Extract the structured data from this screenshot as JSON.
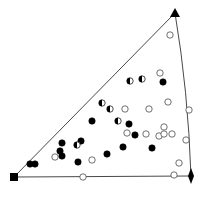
{
  "diagram": {
    "type": "inverse-pole-figure-triangle",
    "corners": {
      "square": {
        "x": 14,
        "y": 177
      },
      "triangle": {
        "x": 175,
        "y": 13
      },
      "diamond": {
        "x": 191,
        "y": 176
      }
    },
    "edges": {
      "left": [
        [
          14,
          177
        ],
        [
          175,
          13
        ]
      ],
      "bottom": [
        [
          14,
          177
        ],
        [
          191,
          176
        ]
      ],
      "right_arc": [
        [
          175,
          13
        ],
        [
          191,
          176
        ]
      ]
    },
    "points": [
      {
        "x": 170,
        "y": 35,
        "type": "open"
      },
      {
        "x": 160,
        "y": 73,
        "type": "open"
      },
      {
        "x": 130,
        "y": 81,
        "type": "half"
      },
      {
        "x": 142,
        "y": 79,
        "type": "half"
      },
      {
        "x": 163,
        "y": 82,
        "type": "filled"
      },
      {
        "x": 102,
        "y": 103,
        "type": "half"
      },
      {
        "x": 110,
        "y": 109,
        "type": "half"
      },
      {
        "x": 125,
        "y": 109,
        "type": "open"
      },
      {
        "x": 149,
        "y": 109,
        "type": "open"
      },
      {
        "x": 168,
        "y": 102,
        "type": "open"
      },
      {
        "x": 189,
        "y": 110,
        "type": "open"
      },
      {
        "x": 92,
        "y": 121,
        "type": "filled"
      },
      {
        "x": 118,
        "y": 121,
        "type": "half"
      },
      {
        "x": 129,
        "y": 124,
        "type": "filled"
      },
      {
        "x": 164,
        "y": 127,
        "type": "open"
      },
      {
        "x": 127,
        "y": 133,
        "type": "open"
      },
      {
        "x": 135,
        "y": 135,
        "type": "filled"
      },
      {
        "x": 146,
        "y": 134,
        "type": "open"
      },
      {
        "x": 159,
        "y": 136,
        "type": "open"
      },
      {
        "x": 164,
        "y": 134,
        "type": "open"
      },
      {
        "x": 172,
        "y": 134,
        "type": "open"
      },
      {
        "x": 186,
        "y": 140,
        "type": "open"
      },
      {
        "x": 62,
        "y": 143,
        "type": "filled"
      },
      {
        "x": 81,
        "y": 141,
        "type": "filled"
      },
      {
        "x": 77,
        "y": 145,
        "type": "half"
      },
      {
        "x": 60,
        "y": 151,
        "type": "filled"
      },
      {
        "x": 62,
        "y": 156,
        "type": "filled"
      },
      {
        "x": 55,
        "y": 157,
        "type": "open"
      },
      {
        "x": 123,
        "y": 147,
        "type": "filled"
      },
      {
        "x": 152,
        "y": 148,
        "type": "filled"
      },
      {
        "x": 107,
        "y": 154,
        "type": "filled"
      },
      {
        "x": 78,
        "y": 162,
        "type": "filled"
      },
      {
        "x": 92,
        "y": 160,
        "type": "open"
      },
      {
        "x": 179,
        "y": 163,
        "type": "open"
      },
      {
        "x": 30,
        "y": 164,
        "type": "filled"
      },
      {
        "x": 35,
        "y": 164,
        "type": "filled"
      },
      {
        "x": 83,
        "y": 177,
        "type": "open"
      },
      {
        "x": 174,
        "y": 175,
        "type": "open"
      }
    ]
  }
}
